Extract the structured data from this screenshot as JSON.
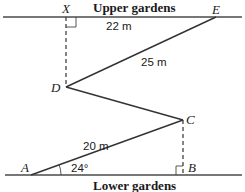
{
  "regions": {
    "upper": "Upper gardens",
    "lower": "Lower gardens"
  },
  "points": {
    "X": "X",
    "E": "E",
    "D": "D",
    "C": "C",
    "A": "A",
    "B": "B"
  },
  "measurements": {
    "XE": "22 m",
    "DE": "25 m",
    "AC": "20 m",
    "angle_A": "24°"
  },
  "colors": {
    "line": "#3a3a3a",
    "text": "#1a1a1a",
    "background": "#ffffff"
  }
}
